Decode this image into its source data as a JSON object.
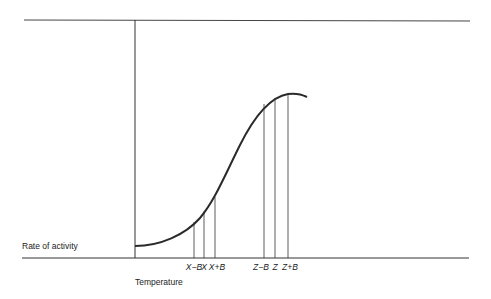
{
  "diagram": {
    "y_axis_label": "Rate of activity",
    "x_axis_label": "Temperature",
    "curve_description": "Sigmoid-shaped rate of activity vs temperature curve, flattening toward a maximum",
    "ticks": [
      {
        "label": "X−B",
        "x": 194
      },
      {
        "label": "X",
        "x": 204
      },
      {
        "label": "X+B",
        "x": 215
      },
      {
        "label": "Z−B",
        "x": 264
      },
      {
        "label": "Z",
        "x": 275
      },
      {
        "label": "Z+B",
        "x": 288
      }
    ],
    "colors": {
      "line": "#2a2a2a",
      "background": "#ffffff"
    }
  }
}
